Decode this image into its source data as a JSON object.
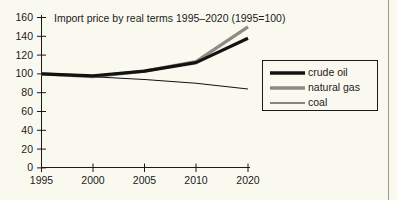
{
  "chart_data": {
    "type": "line",
    "title": "Import price by real terms 1995–2020 (1995=100)",
    "xlabel": "",
    "ylabel": "",
    "grid": false,
    "legend_position": "right",
    "x": [
      1995,
      2000,
      2005,
      2010,
      2020
    ],
    "x_tick_labels": [
      "1995",
      "2000",
      "2005",
      "2010",
      "2020"
    ],
    "y_tick_labels": [
      "0",
      "20",
      "40",
      "60",
      "80",
      "100",
      "120",
      "140",
      "160"
    ],
    "y_ticks": [
      0,
      20,
      40,
      60,
      80,
      100,
      120,
      140,
      160
    ],
    "ylim": [
      0,
      160
    ],
    "series": [
      {
        "name": "crude oil",
        "color": "#121212",
        "width": 3.2,
        "values": [
          100,
          98,
          103,
          112,
          138
        ]
      },
      {
        "name": "natural gas",
        "color": "#8c8c84",
        "width": 3.2,
        "values": [
          100,
          97,
          103,
          113,
          150
        ]
      },
      {
        "name": "coal",
        "color": "#121212",
        "width": 1.1,
        "values": [
          100,
          97,
          94,
          90,
          84
        ]
      }
    ]
  },
  "legend": {
    "items": [
      {
        "label": "crude oil"
      },
      {
        "label": "natural gas"
      },
      {
        "label": "coal"
      }
    ]
  },
  "colors": {
    "background": "#faf9f0",
    "ink": "#1a1a1a",
    "crude_oil": "#121212",
    "natural_gas": "#8c8c84",
    "coal": "#121212"
  }
}
